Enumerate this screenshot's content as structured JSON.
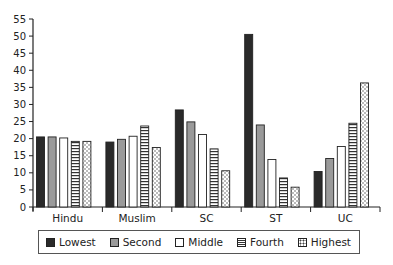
{
  "chart_data": {
    "type": "bar",
    "title": "",
    "xlabel": "",
    "ylabel": "",
    "ylim": [
      0,
      55
    ],
    "yticks": [
      0,
      5,
      10,
      15,
      20,
      25,
      30,
      35,
      40,
      45,
      50,
      55
    ],
    "grid": false,
    "legend_position": "bottom",
    "categories": [
      "Hindu",
      "Muslim",
      "SC",
      "ST",
      "UC"
    ],
    "series": [
      {
        "name": "Lowest",
        "pattern": "solid-dark",
        "values": [
          20.5,
          19.0,
          28.4,
          50.5,
          10.4
        ]
      },
      {
        "name": "Second",
        "pattern": "solid-gray",
        "values": [
          20.5,
          19.8,
          24.9,
          24.0,
          14.2
        ]
      },
      {
        "name": "Middle",
        "pattern": "white",
        "values": [
          20.2,
          20.7,
          21.2,
          13.9,
          17.7
        ]
      },
      {
        "name": "Fourth",
        "pattern": "horizontal-lines",
        "values": [
          19.2,
          23.7,
          17.0,
          8.5,
          24.5
        ]
      },
      {
        "name": "Highest",
        "pattern": "dotted",
        "values": [
          19.2,
          17.4,
          10.6,
          5.8,
          36.3
        ]
      }
    ]
  },
  "legend": {
    "items": [
      {
        "label": "Lowest"
      },
      {
        "label": "Second"
      },
      {
        "label": "Middle"
      },
      {
        "label": "Fourth"
      },
      {
        "label": "Highest"
      }
    ]
  }
}
